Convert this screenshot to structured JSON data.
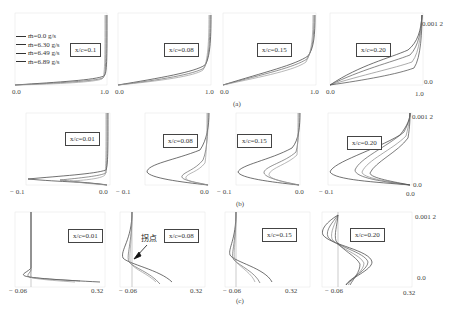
{
  "legend": {
    "entries": [
      "ṁ=0.0 g/s",
      "ṁ=6.30 g/s",
      "ṁ=6.49 g/s",
      "ṁ=6.89 g/s"
    ]
  },
  "rows": [
    {
      "caption": "(a)",
      "panels": [
        {
          "label": "x/c=0.1",
          "xmin": "0.0",
          "xmax": "1.0"
        },
        {
          "label": "x/c=0.08",
          "xmin": "0.0",
          "xmax": "1.0"
        },
        {
          "label": "x/c=0.15",
          "xmin": "0.0",
          "xmax": "1.0"
        },
        {
          "label": "x/c=0.20",
          "xmin": "0.0",
          "xmax": "1.0"
        }
      ],
      "ytop": "0.001 2",
      "ybottom": "0.0"
    },
    {
      "caption": "(b)",
      "panels": [
        {
          "label": "x/c=0.01",
          "xmin": "− 0.1",
          "xmax": "0.0"
        },
        {
          "label": "x/c=0.08",
          "xmin": "− 0.1",
          "xmax": "0.0"
        },
        {
          "label": "x/c=0.15",
          "xmin": "− 0.1",
          "xmax": "0.0"
        },
        {
          "label": "x/c=0.20",
          "xmin": "− 0.1",
          "xmax": "0.0"
        }
      ],
      "ytop": "0.001 2",
      "ybottom": "0.0"
    },
    {
      "caption": "(c)",
      "panels": [
        {
          "label": "x/c=0.01",
          "xmin": "− 0.06",
          "xmax": "0.32"
        },
        {
          "label": "x/c=0.08",
          "xmin": "− 0.06",
          "xmax": "0.32"
        },
        {
          "label": "x/c=0.15",
          "xmin": "− 0.06",
          "xmax": "0.32"
        },
        {
          "label": "x/c=0.20",
          "xmin": "− 0.06",
          "xmax": "0.32"
        }
      ],
      "ytop": "0.001 2",
      "ybottom": "0.0",
      "annotation": "拐点"
    }
  ]
}
